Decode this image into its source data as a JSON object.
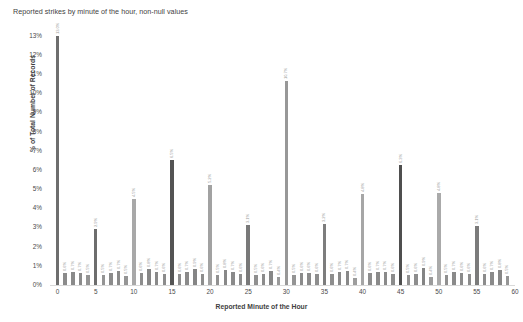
{
  "chart_data": {
    "type": "bar",
    "title": "Reported strikes by minute of the hour, non-null values",
    "xlabel": "Reported Minute of the Hour",
    "ylabel": "% of Total Number of Records",
    "ylim": [
      0,
      13.4
    ],
    "xlim": [
      -1,
      60
    ],
    "grid": false,
    "legend": null,
    "ytick_labels": [
      "13%",
      "12%",
      "11%",
      "10%",
      "9%",
      "8%",
      "7%",
      "6%",
      "5%",
      "4%",
      "3%",
      "2%",
      "1%",
      "0%"
    ],
    "ytick_values": [
      13,
      12,
      11,
      10,
      9,
      8,
      7,
      6,
      5,
      4,
      3,
      2,
      1,
      0
    ],
    "xtick_labels": [
      "0",
      "5",
      "10",
      "15",
      "20",
      "25",
      "30",
      "35",
      "40",
      "45",
      "50",
      "55",
      "60"
    ],
    "xtick_values": [
      0,
      5,
      10,
      15,
      20,
      25,
      30,
      35,
      40,
      45,
      50,
      55,
      60
    ],
    "categories": [
      0,
      1,
      2,
      3,
      4,
      5,
      6,
      7,
      8,
      9,
      10,
      11,
      12,
      13,
      14,
      15,
      16,
      17,
      18,
      19,
      20,
      21,
      22,
      23,
      24,
      25,
      26,
      27,
      28,
      29,
      30,
      31,
      32,
      33,
      34,
      35,
      36,
      37,
      38,
      39,
      40,
      41,
      42,
      43,
      44,
      45,
      46,
      47,
      48,
      49,
      50,
      51,
      52,
      53,
      54,
      55,
      56,
      57,
      58,
      59
    ],
    "values": [
      13.0,
      0.65,
      0.7,
      0.65,
      0.5,
      2.92,
      0.5,
      0.65,
      0.72,
      0.48,
      4.46,
      0.62,
      0.84,
      0.66,
      0.6,
      6.54,
      0.58,
      0.68,
      0.86,
      0.58,
      5.2,
      0.52,
      0.76,
      0.68,
      0.6,
      3.14,
      0.54,
      0.6,
      0.74,
      0.42,
      10.66,
      0.5,
      0.64,
      0.64,
      0.56,
      3.18,
      0.58,
      0.68,
      0.72,
      0.36,
      4.76,
      0.62,
      0.7,
      0.7,
      0.6,
      6.28,
      0.54,
      0.58,
      0.88,
      0.4,
      4.8,
      0.54,
      0.7,
      0.64,
      0.58,
      3.08,
      0.6,
      0.66,
      0.78,
      0.48
    ],
    "value_labels": [
      "13.0%",
      "0.6%",
      "0.7%",
      "0.7%",
      "0.5%",
      "2.9%",
      "0.5%",
      "0.7%",
      "0.7%",
      "0.5%",
      "4.5%",
      "0.6%",
      "0.8%",
      "0.7%",
      "0.6%",
      "6.5%",
      "0.6%",
      "0.7%",
      "0.9%",
      "0.6%",
      "5.2%",
      "0.5%",
      "0.8%",
      "0.7%",
      "0.6%",
      "3.1%",
      "0.5%",
      "0.6%",
      "0.7%",
      "0.4%",
      "10.7%",
      "0.5%",
      "0.6%",
      "0.6%",
      "0.6%",
      "3.2%",
      "0.6%",
      "0.7%",
      "0.7%",
      "0.4%",
      "4.8%",
      "0.6%",
      "0.7%",
      "0.7%",
      "0.6%",
      "6.3%",
      "0.5%",
      "0.6%",
      "0.9%",
      "0.4%",
      "4.8%",
      "0.5%",
      "0.7%",
      "0.6%",
      "0.6%",
      "3.1%",
      "0.6%",
      "0.7%",
      "0.8%",
      "0.5%"
    ],
    "bar_colors": [
      "#6e6e6e",
      "#8b8b8b",
      "#8a8a8a",
      "#8b8b8b",
      "#949494",
      "#6d6d6d",
      "#949494",
      "#8b8b8b",
      "#8a8a8a",
      "#959595",
      "#a8a8a8",
      "#8d8d8d",
      "#868686",
      "#8a8a8a",
      "#8c8c8c",
      "#545454",
      "#8d8d8d",
      "#8a8a8a",
      "#858585",
      "#8d8d8d",
      "#a2a2a2",
      "#919191",
      "#888888",
      "#8a8a8a",
      "#8c8c8c",
      "#797979",
      "#909090",
      "#8c8c8c",
      "#878787",
      "#9a9a9a",
      "#989898",
      "#949494",
      "#8b8b8b",
      "#8b8b8b",
      "#8e8e8e",
      "#7d7d7d",
      "#8d8d8d",
      "#8a8a8a",
      "#898989",
      "#9d9d9d",
      "#a6a6a6",
      "#8d8d8d",
      "#8a8a8a",
      "#8a8a8a",
      "#8c8c8c",
      "#4f4f4f",
      "#909090",
      "#8d8d8d",
      "#848484",
      "#9b9b9b",
      "#aaaaaa",
      "#909090",
      "#8a8a8a",
      "#8b8b8b",
      "#8d8d8d",
      "#7b7b7b",
      "#8c8c8c",
      "#8a8a8a",
      "#878787",
      "#959595"
    ],
    "axis_color": "#d9d9d9",
    "label_color": "#9a9a9a",
    "text_color": "#3f3f3f",
    "background": "#ffffff"
  }
}
